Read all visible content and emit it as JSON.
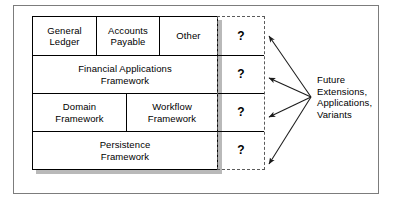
{
  "diagram": {
    "outer_frame": {
      "style": "thin solid border"
    },
    "layer_stack": {
      "rows": [
        {
          "id": "applications",
          "cells": [
            {
              "label": "General\nLedger"
            },
            {
              "label": "Accounts\nPayable"
            },
            {
              "label": "Other"
            }
          ]
        },
        {
          "id": "financial-applications-framework",
          "cells": [
            {
              "label": "Financial Applications\nFramework"
            }
          ]
        },
        {
          "id": "domain-workflow",
          "cells": [
            {
              "label": "Domain\nFramework"
            },
            {
              "label": "Workflow\nFramework"
            }
          ]
        },
        {
          "id": "persistence-framework",
          "cells": [
            {
              "label": "Persistence\nFramework"
            }
          ]
        }
      ]
    },
    "question_column": {
      "border_style": "dashed",
      "cells": [
        {
          "label": "?"
        },
        {
          "label": "?"
        },
        {
          "label": "?"
        },
        {
          "label": "?"
        }
      ]
    },
    "annotation": {
      "lines": [
        "Future",
        "Extensions,",
        "Applications,",
        "Variants"
      ],
      "text": "Future Extensions, Applications, Variants"
    },
    "arrows": {
      "count": 4,
      "origin": {
        "x": 311,
        "y": 97
      },
      "targets": [
        {
          "x": 268,
          "y": 35
        },
        {
          "x": 268,
          "y": 78
        },
        {
          "x": 268,
          "y": 117
        },
        {
          "x": 268,
          "y": 163
        }
      ]
    },
    "colors": {
      "line": "#000000",
      "frame": "#7c7c7c",
      "dashed": "#5a5a5a",
      "shadow": "#b9b9b9",
      "background": "#ffffff",
      "text": "#000000"
    }
  }
}
